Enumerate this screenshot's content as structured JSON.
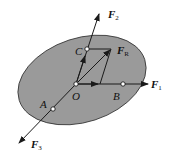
{
  "diagram": {
    "plate_color": "#9a9a9a",
    "line_color": "#1a1a1a",
    "points": {
      "O": "O",
      "A": "A",
      "B": "B",
      "C": "C"
    },
    "forces": {
      "F1": {
        "symbol": "F",
        "sub": "1"
      },
      "F2": {
        "symbol": "F",
        "sub": "2"
      },
      "F3": {
        "symbol": "F",
        "sub": "3"
      },
      "FR": {
        "symbol": "F",
        "sub": "R"
      }
    }
  }
}
